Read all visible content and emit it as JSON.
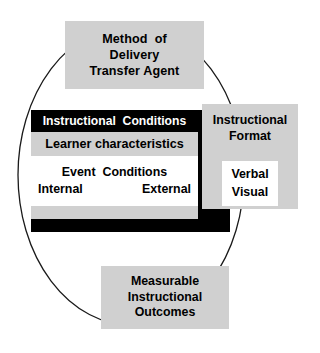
{
  "diagram": {
    "colors": {
      "gray_fill": "#d0d0d0",
      "black_fill": "#000000",
      "white_fill": "#ffffff",
      "outline": "#1a1a1a"
    },
    "method_box": {
      "line1": "Method  of",
      "line2": "Delivery",
      "line3": "Transfer Agent"
    },
    "conditions": {
      "title": "Instructional  Conditions",
      "learner": "Learner characteristics",
      "event_title": "Event  Conditions",
      "event_internal": "Internal",
      "event_external": "External"
    },
    "format_box": {
      "line1": "Instructional",
      "line2": "Format",
      "verbal": "Verbal",
      "visual": "Visual"
    },
    "outcomes_box": {
      "line1": "Measurable",
      "line2": "Instructional",
      "line3": "Outcomes"
    }
  }
}
